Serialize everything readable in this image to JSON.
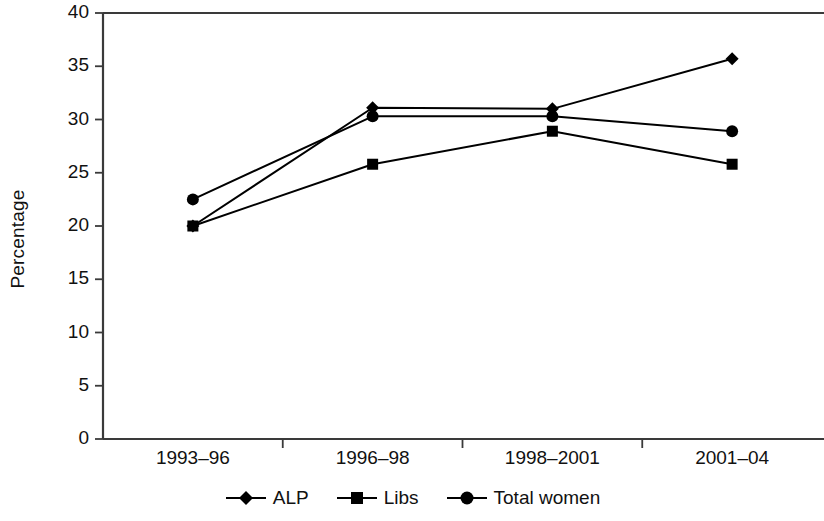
{
  "chart_data": {
    "type": "line",
    "title": "",
    "xlabel": "",
    "ylabel": "Percentage",
    "categories": [
      "1993–96",
      "1996–98",
      "1998–2001",
      "2001–04"
    ],
    "ylim": [
      0,
      40
    ],
    "ytick_labels": [
      "0",
      "5",
      "10",
      "15",
      "20",
      "25",
      "30",
      "35",
      "40"
    ],
    "ytick_values": [
      0,
      5,
      10,
      15,
      20,
      25,
      30,
      35,
      40
    ],
    "grid": false,
    "legend_position": "bottom",
    "series": [
      {
        "name": "ALP",
        "marker": "diamond",
        "color": "#000000",
        "values": [
          20.0,
          31.1,
          31.0,
          35.7
        ]
      },
      {
        "name": "Libs",
        "marker": "square",
        "color": "#000000",
        "values": [
          20.0,
          25.8,
          28.9,
          25.8
        ]
      },
      {
        "name": "Total women",
        "marker": "circle",
        "color": "#000000",
        "values": [
          22.5,
          30.3,
          30.3,
          28.9
        ]
      }
    ]
  },
  "legend": {
    "items": [
      {
        "label": "ALP",
        "marker": "diamond-marker-icon"
      },
      {
        "label": "Libs",
        "marker": "square-marker-icon"
      },
      {
        "label": "Total women",
        "marker": "circle-marker-icon"
      }
    ]
  }
}
